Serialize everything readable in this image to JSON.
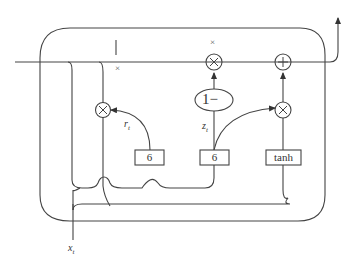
{
  "diagram": {
    "type": "GRU cell",
    "labels": {
      "reset_gate": "r",
      "reset_gate_sub": "t",
      "update_gate": "z",
      "update_gate_sub": "t",
      "input": "x",
      "input_sub": "t",
      "one_minus": "1−",
      "top_multiply_mark": "×",
      "left_multiply_mark": "×",
      "hidden_tick": "|"
    },
    "boxes": [
      {
        "id": "sigma-reset",
        "label": "6"
      },
      {
        "id": "sigma-update",
        "label": "6"
      },
      {
        "id": "tanh",
        "label": "tanh"
      }
    ],
    "operators": [
      {
        "id": "mul-reset",
        "symbol": "×"
      },
      {
        "id": "mul-top",
        "symbol": "×"
      },
      {
        "id": "add-top",
        "symbol": "+"
      },
      {
        "id": "mul-right",
        "symbol": "×"
      }
    ],
    "colors": {
      "stroke": "#444444",
      "background": "#ffffff"
    }
  }
}
